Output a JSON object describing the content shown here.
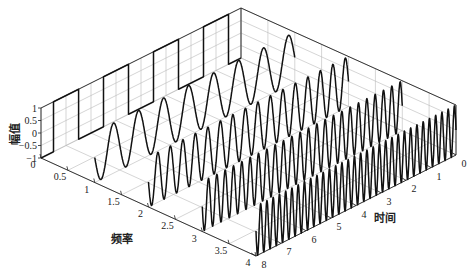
{
  "chart_data": {
    "type": "line",
    "subtype": "3d-waterfall",
    "title": "",
    "xlabel": "时间",
    "ylabel": "频率",
    "zlabel": "幅值",
    "x_axis": {
      "name": "time",
      "range": [
        0,
        8
      ],
      "ticks": [
        0,
        1,
        2,
        3,
        4,
        5,
        6,
        7,
        8
      ],
      "tick_labels": [
        "0",
        "1",
        "2",
        "3",
        "4",
        "5",
        "6",
        "7",
        "8"
      ]
    },
    "y_axis": {
      "name": "frequency",
      "range": [
        0,
        4
      ],
      "ticks": [
        0,
        0.5,
        1,
        1.5,
        2,
        2.5,
        3,
        3.5,
        4
      ],
      "tick_labels": [
        "0",
        "0.5",
        "1",
        "1.5",
        "2",
        "2.5",
        "3",
        "3.5",
        "4"
      ]
    },
    "z_axis": {
      "name": "amplitude",
      "range": [
        -1,
        1
      ],
      "ticks": [
        -1,
        -0.5,
        0,
        0.5,
        1
      ],
      "tick_labels": [
        "-1",
        "-0.5",
        "0",
        "0.5",
        "1"
      ]
    },
    "grid": true,
    "series": [
      {
        "name": "square wave",
        "frequency": 0,
        "shape": "square",
        "period": 2,
        "amplitude": 1,
        "cycles_shown": 4
      },
      {
        "name": "sine f=1",
        "frequency": 1,
        "shape": "sine",
        "amplitude": 1,
        "cycles_shown": 8
      },
      {
        "name": "sine f=2",
        "frequency": 2,
        "shape": "sine",
        "amplitude": 0.5,
        "cycles_shown": 16
      },
      {
        "name": "sine f=3",
        "frequency": 3,
        "shape": "sine",
        "amplitude": 0.33,
        "cycles_shown": 24
      },
      {
        "name": "sine f=4",
        "frequency": 4,
        "shape": "sine",
        "amplitude": 0.25,
        "cycles_shown": 32
      }
    ]
  },
  "labels": {
    "zlabel": "幅值",
    "ylabel": "频率",
    "xlabel": "时间"
  }
}
